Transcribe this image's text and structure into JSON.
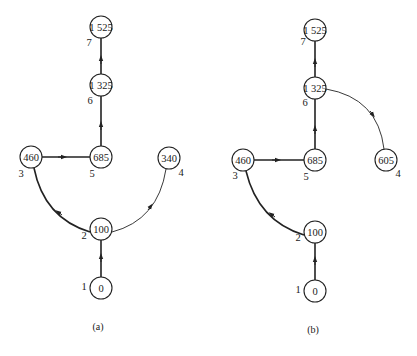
{
  "diagrams": [
    {
      "caption": "(a)",
      "nodes": [
        {
          "id": "1",
          "value": "0"
        },
        {
          "id": "2",
          "value": "100"
        },
        {
          "id": "3",
          "value": "460"
        },
        {
          "id": "4",
          "value": "340"
        },
        {
          "id": "5",
          "value": "685"
        },
        {
          "id": "6",
          "value": "1 325"
        },
        {
          "id": "7",
          "value": "1 525"
        }
      ],
      "edges": [
        {
          "from": "1",
          "to": "2"
        },
        {
          "from": "2",
          "to": "3"
        },
        {
          "from": "2",
          "to": "4"
        },
        {
          "from": "3",
          "to": "5"
        },
        {
          "from": "5",
          "to": "6"
        },
        {
          "from": "6",
          "to": "7"
        }
      ]
    },
    {
      "caption": "(b)",
      "nodes": [
        {
          "id": "1",
          "value": "0"
        },
        {
          "id": "2",
          "value": "100"
        },
        {
          "id": "3",
          "value": "460"
        },
        {
          "id": "4",
          "value": "605"
        },
        {
          "id": "5",
          "value": "685"
        },
        {
          "id": "6",
          "value": "1 325"
        },
        {
          "id": "7",
          "value": "1 525"
        }
      ],
      "edges": [
        {
          "from": "1",
          "to": "2"
        },
        {
          "from": "2",
          "to": "3"
        },
        {
          "from": "3",
          "to": "5"
        },
        {
          "from": "5",
          "to": "6"
        },
        {
          "from": "6",
          "to": "7"
        },
        {
          "from": "6",
          "to": "4"
        }
      ]
    }
  ]
}
